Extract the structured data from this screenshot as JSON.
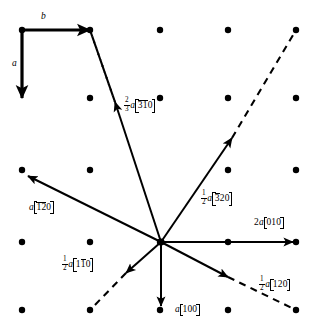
{
  "figure": {
    "name": "crystallographic-lattice-vector-diagram",
    "width": 331,
    "height": 334,
    "background_color": "#ffffff",
    "ink_color": "#000000"
  },
  "unit_cell": {
    "a_label": "a",
    "b_label": "b",
    "a_vector": {
      "x1": 22,
      "y1": 30,
      "x2": 22,
      "y2": 98
    },
    "b_vector": {
      "x1": 22,
      "y1": 30,
      "x2": 90,
      "y2": 30
    }
  },
  "lattice": {
    "description": "rectangular array of filled lattice points",
    "columns_x": [
      22,
      90,
      160,
      228,
      296
    ],
    "rows_y": [
      30,
      98,
      170,
      242,
      310
    ],
    "dot_radius": 3.2,
    "points": [
      {
        "x": 22,
        "y": 30
      },
      {
        "x": 90,
        "y": 30
      },
      {
        "x": 160,
        "y": 30
      },
      {
        "x": 228,
        "y": 30
      },
      {
        "x": 296,
        "y": 30
      },
      {
        "x": 90,
        "y": 98
      },
      {
        "x": 160,
        "y": 98
      },
      {
        "x": 228,
        "y": 98
      },
      {
        "x": 296,
        "y": 98
      },
      {
        "x": 22,
        "y": 170
      },
      {
        "x": 90,
        "y": 170
      },
      {
        "x": 228,
        "y": 170
      },
      {
        "x": 296,
        "y": 170
      },
      {
        "x": 22,
        "y": 242
      },
      {
        "x": 90,
        "y": 242
      },
      {
        "x": 160,
        "y": 242
      },
      {
        "x": 228,
        "y": 242
      },
      {
        "x": 296,
        "y": 242
      },
      {
        "x": 22,
        "y": 310
      },
      {
        "x": 90,
        "y": 310
      },
      {
        "x": 160,
        "y": 310
      },
      {
        "x": 228,
        "y": 310
      },
      {
        "x": 296,
        "y": 310
      }
    ]
  },
  "origin": {
    "x": 161,
    "y": 242
  },
  "vectors": [
    {
      "id": "v-23a-310",
      "name": "two-thirds-a-3bar-1bar-0",
      "numerator": "2",
      "denominator": "3",
      "coefficient_text": "2/3",
      "lattice_symbol": "a",
      "indices": [
        {
          "digit": "3",
          "bar": true
        },
        {
          "digit": "1",
          "bar": true
        },
        {
          "digit": "0",
          "bar": false
        }
      ],
      "tip": {
        "x": 115,
        "y": 102
      },
      "dashed_extension_to": {
        "x": 90,
        "y": 30
      },
      "label_text": "a",
      "label_pos": {
        "x": 124,
        "y": 100
      }
    },
    {
      "id": "v-half-a-320",
      "name": "half-a-3bar-2-0",
      "coefficient_text": "1/2",
      "lattice_symbol": "a",
      "indices": [
        {
          "digit": "3",
          "bar": true
        },
        {
          "digit": "2",
          "bar": false
        },
        {
          "digit": "0",
          "bar": false
        }
      ],
      "tip": {
        "x": 232,
        "y": 138
      },
      "dashed_extension_to": {
        "x": 296,
        "y": 30
      },
      "label_pos": {
        "x": 201,
        "y": 191
      }
    },
    {
      "id": "v-a-120",
      "name": "a-1bar-2bar-0",
      "coefficient_text": "",
      "lattice_symbol": "a",
      "indices": [
        {
          "digit": "1",
          "bar": true
        },
        {
          "digit": "2",
          "bar": true
        },
        {
          "digit": "0",
          "bar": false
        }
      ],
      "tip": {
        "x": 28,
        "y": 176
      },
      "dashed_extension_to": null,
      "label_pos": {
        "x": 29,
        "y": 203
      }
    },
    {
      "id": "v-2a-010",
      "name": "two-a-0-1-0",
      "coefficient_text": "2",
      "lattice_symbol": "a",
      "indices": [
        {
          "digit": "0",
          "bar": false
        },
        {
          "digit": "1",
          "bar": false
        },
        {
          "digit": "0",
          "bar": false
        }
      ],
      "tip": {
        "x": 293,
        "y": 242
      },
      "dashed_extension_to": null,
      "label_pos": {
        "x": 254,
        "y": 219
      }
    },
    {
      "id": "v-half-a-120",
      "name": "half-a-1-2-0",
      "coefficient_text": "1/2",
      "lattice_symbol": "a",
      "indices": [
        {
          "digit": "1",
          "bar": false
        },
        {
          "digit": "2",
          "bar": false
        },
        {
          "digit": "0",
          "bar": false
        }
      ],
      "tip": {
        "x": 228,
        "y": 277
      },
      "dashed_extension_to": {
        "x": 296,
        "y": 310
      },
      "label_pos": {
        "x": 259,
        "y": 277
      }
    },
    {
      "id": "v-a-100",
      "name": "a-1-0-0",
      "coefficient_text": "",
      "lattice_symbol": "a",
      "indices": [
        {
          "digit": "1",
          "bar": false
        },
        {
          "digit": "0",
          "bar": false
        },
        {
          "digit": "0",
          "bar": false
        }
      ],
      "tip": {
        "x": 161,
        "y": 306
      },
      "dashed_extension_to": null,
      "label_pos": {
        "x": 175,
        "y": 306
      }
    },
    {
      "id": "v-half-a-110",
      "name": "half-a-1-1bar-0",
      "coefficient_text": "1/2",
      "lattice_symbol": "a",
      "indices": [
        {
          "digit": "1",
          "bar": false
        },
        {
          "digit": "1",
          "bar": true
        },
        {
          "digit": "0",
          "bar": false
        }
      ],
      "tip": {
        "x": 126,
        "y": 273
      },
      "dashed_extension_to": {
        "x": 90,
        "y": 310
      },
      "label_pos": {
        "x": 62,
        "y": 257
      }
    }
  ],
  "dashed_cell_edge": {
    "name": "unit-cell-dashed-boundary",
    "from": {
      "x": 90,
      "y": 30
    },
    "to": {
      "x": 115,
      "y": 102
    }
  }
}
